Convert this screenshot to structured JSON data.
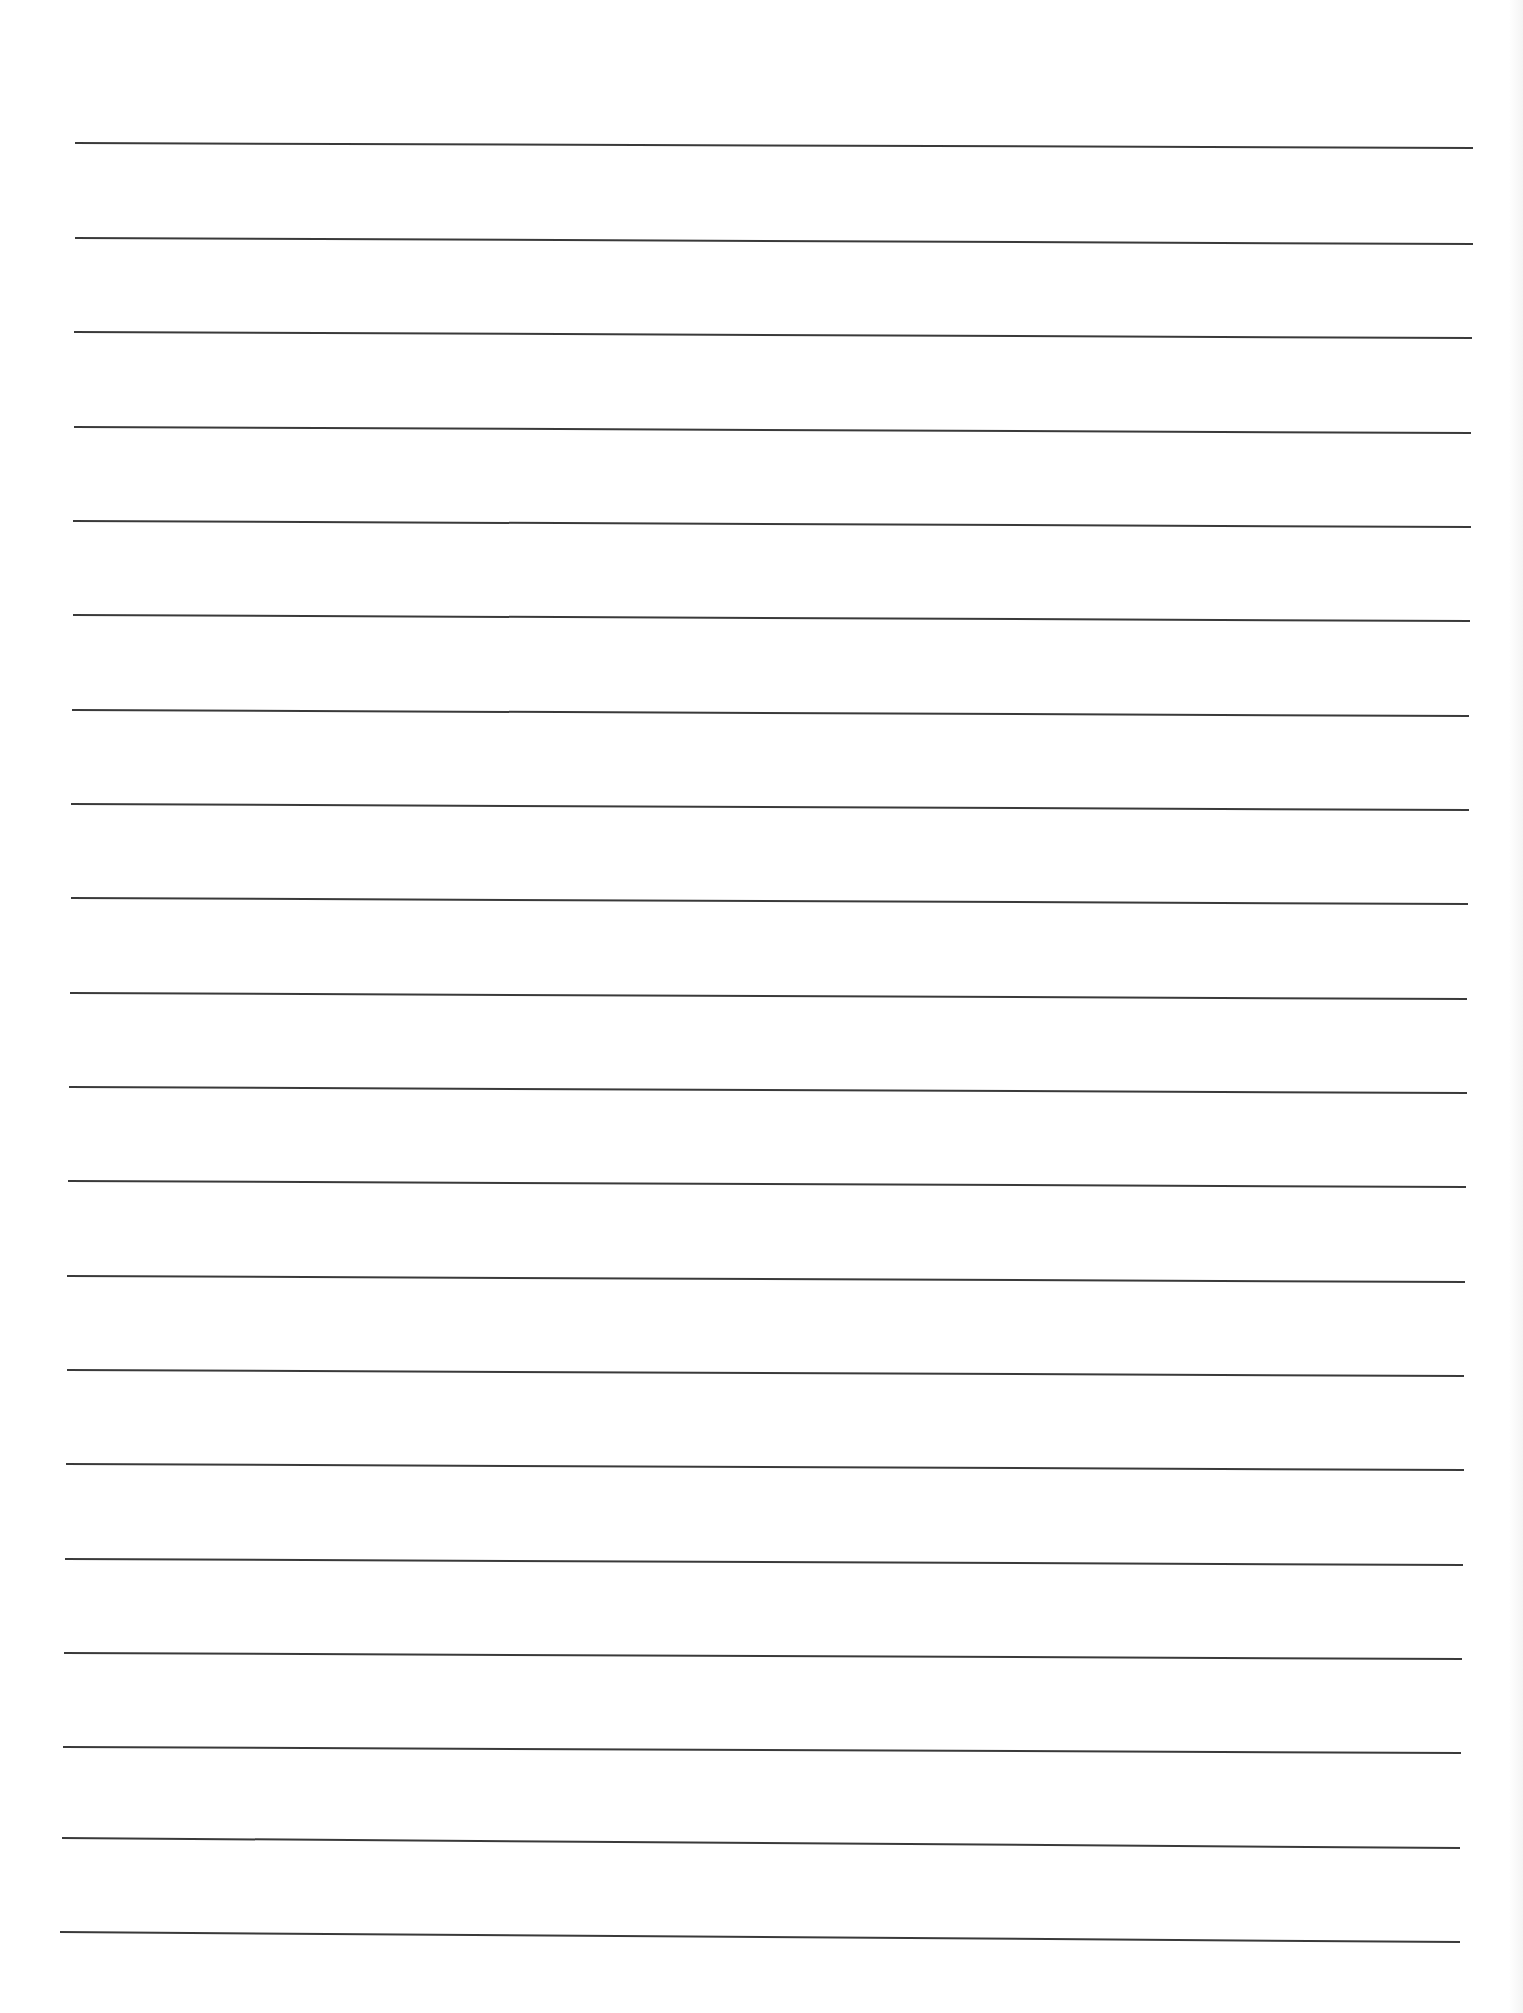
{
  "document": {
    "type": "lined-paper",
    "background_color": "#ffffff",
    "line_color": "#3a3a3a",
    "line_count": 20,
    "text_content": ""
  },
  "rules": [
    {
      "index": 1,
      "x1": 75,
      "y1": 143,
      "x2": 1473,
      "y2": 148
    },
    {
      "index": 2,
      "x1": 75,
      "y1": 238,
      "x2": 1473,
      "y2": 244
    },
    {
      "index": 3,
      "x1": 74,
      "y1": 332,
      "x2": 1472,
      "y2": 338
    },
    {
      "index": 4,
      "x1": 74,
      "y1": 427,
      "x2": 1471,
      "y2": 433
    },
    {
      "index": 5,
      "x1": 73,
      "y1": 521,
      "x2": 1471,
      "y2": 527
    },
    {
      "index": 6,
      "x1": 73,
      "y1": 615,
      "x2": 1470,
      "y2": 621
    },
    {
      "index": 7,
      "x1": 72,
      "y1": 710,
      "x2": 1469,
      "y2": 716
    },
    {
      "index": 8,
      "x1": 71,
      "y1": 804,
      "x2": 1469,
      "y2": 810
    },
    {
      "index": 9,
      "x1": 71,
      "y1": 898,
      "x2": 1468,
      "y2": 904
    },
    {
      "index": 10,
      "x1": 70,
      "y1": 993,
      "x2": 1467,
      "y2": 999
    },
    {
      "index": 11,
      "x1": 69,
      "y1": 1087,
      "x2": 1467,
      "y2": 1093
    },
    {
      "index": 12,
      "x1": 68,
      "y1": 1181,
      "x2": 1466,
      "y2": 1187
    },
    {
      "index": 13,
      "x1": 67,
      "y1": 1276,
      "x2": 1465,
      "y2": 1282
    },
    {
      "index": 14,
      "x1": 67,
      "y1": 1370,
      "x2": 1464,
      "y2": 1376
    },
    {
      "index": 15,
      "x1": 66,
      "y1": 1464,
      "x2": 1464,
      "y2": 1470
    },
    {
      "index": 16,
      "x1": 65,
      "y1": 1559,
      "x2": 1463,
      "y2": 1565
    },
    {
      "index": 17,
      "x1": 64,
      "y1": 1653,
      "x2": 1462,
      "y2": 1659
    },
    {
      "index": 18,
      "x1": 63,
      "y1": 1747,
      "x2": 1461,
      "y2": 1753
    },
    {
      "index": 19,
      "x1": 62,
      "y1": 1838,
      "x2": 1460,
      "y2": 1848
    },
    {
      "index": 20,
      "x1": 60,
      "y1": 1932,
      "x2": 1460,
      "y2": 1942
    }
  ]
}
